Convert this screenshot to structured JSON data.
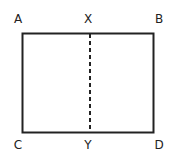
{
  "diagram": {
    "shape": "rectangle",
    "fold_line": "dashed",
    "labels": {
      "top_left": "A",
      "top_middle": "X",
      "top_right": "B",
      "bottom_left": "C",
      "bottom_middle": "Y",
      "bottom_right": "D"
    },
    "colors": {
      "stroke": "#222222",
      "background": "#ffffff"
    }
  }
}
